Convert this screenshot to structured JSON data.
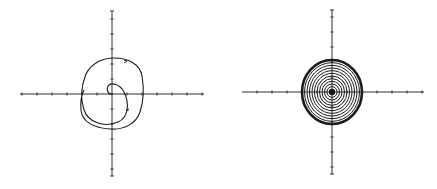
{
  "figure": {
    "background": "#ffffff",
    "ink": "#1a1a1a",
    "panels": [
      {
        "id": "left",
        "description": "Phase portrait: trajectory spiralling outward from origin to a closed outer loop",
        "origin": [
          112,
          94
        ],
        "x_axis": [
          20,
          204
        ],
        "y_axis": [
          11,
          176
        ],
        "tick_spacing": 15,
        "axis_labels": [],
        "tick_labels": []
      },
      {
        "id": "right",
        "description": "Phase portrait: dense concentric closed orbits (nested ellipses) around a center point, bold outer boundary",
        "origin": [
          332,
          92
        ],
        "x_axis": [
          242,
          424
        ],
        "y_axis": [
          10,
          174
        ],
        "tick_spacing": 15,
        "rings": 12,
        "outer_rx": 30,
        "outer_ry": 32,
        "axis_labels": [],
        "tick_labels": []
      }
    ]
  }
}
